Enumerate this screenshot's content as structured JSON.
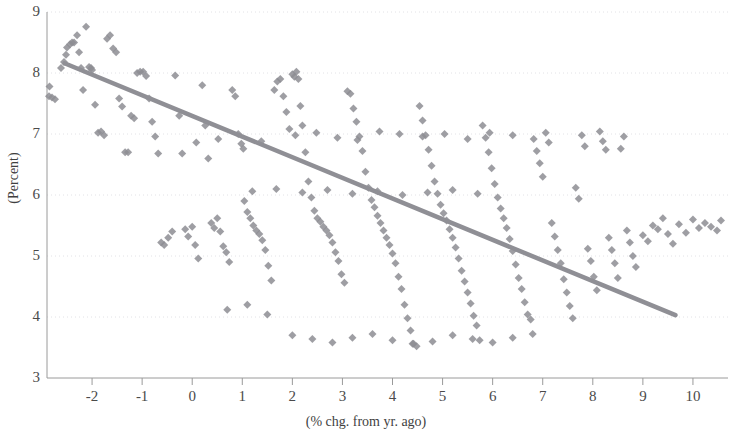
{
  "chart_data": {
    "type": "scatter",
    "title": "",
    "xlabel": "(% chg. from yr. ago)",
    "ylabel": "(Percent)",
    "xlim": [
      -2.9,
      10.7
    ],
    "ylim": [
      3,
      9
    ],
    "xticks": [
      "-2",
      "-1",
      "0",
      "1",
      "2",
      "3",
      "4",
      "5",
      "6",
      "7",
      "8",
      "9",
      "10"
    ],
    "xtick_values": [
      -2,
      -1,
      0,
      1,
      2,
      3,
      4,
      5,
      6,
      7,
      8,
      9,
      10
    ],
    "yticks": [
      "3",
      "4",
      "5",
      "6",
      "7",
      "8",
      "9"
    ],
    "ytick_values": [
      3,
      4,
      5,
      6,
      7,
      8,
      9
    ],
    "grid": true,
    "grid_axis": "y",
    "legend": "none",
    "marker_color": "#8d8d93",
    "marker_shape": "diamond",
    "marker_size": 4,
    "trendline": {
      "color": "#8f8f95",
      "width": 4.5,
      "x0": -2.55,
      "y0": 8.16,
      "x1": 9.65,
      "y1": 4.03
    },
    "points": [
      [
        -2.85,
        7.78
      ],
      [
        -2.86,
        7.62
      ],
      [
        -2.8,
        7.6
      ],
      [
        -2.74,
        7.57
      ],
      [
        -2.62,
        8.08
      ],
      [
        -2.56,
        8.18
      ],
      [
        -2.52,
        8.3
      ],
      [
        -2.5,
        8.42
      ],
      [
        -2.44,
        8.47
      ],
      [
        -2.4,
        8.5
      ],
      [
        -2.36,
        8.5
      ],
      [
        -2.3,
        8.62
      ],
      [
        -2.26,
        8.34
      ],
      [
        -2.22,
        8.08
      ],
      [
        -2.18,
        7.72
      ],
      [
        -2.12,
        8.76
      ],
      [
        -2.06,
        8.1
      ],
      [
        -2.0,
        8.05
      ],
      [
        -2.02,
        8.08
      ],
      [
        -1.94,
        7.48
      ],
      [
        -1.88,
        7.02
      ],
      [
        -1.82,
        7.04
      ],
      [
        -1.76,
        6.98
      ],
      [
        -1.7,
        8.56
      ],
      [
        -1.64,
        8.62
      ],
      [
        -1.58,
        8.4
      ],
      [
        -1.52,
        8.34
      ],
      [
        -1.46,
        7.58
      ],
      [
        -1.4,
        7.45
      ],
      [
        -1.34,
        6.7
      ],
      [
        -1.28,
        6.7
      ],
      [
        -1.22,
        7.3
      ],
      [
        -1.16,
        7.26
      ],
      [
        -1.1,
        8.0
      ],
      [
        -1.04,
        8.02
      ],
      [
        -0.98,
        8.02
      ],
      [
        -0.92,
        7.95
      ],
      [
        -0.86,
        7.58
      ],
      [
        -0.8,
        7.2
      ],
      [
        -0.74,
        6.96
      ],
      [
        -0.68,
        6.68
      ],
      [
        -0.62,
        5.22
      ],
      [
        -0.56,
        5.18
      ],
      [
        -0.48,
        5.3
      ],
      [
        -0.4,
        5.4
      ],
      [
        -0.34,
        7.96
      ],
      [
        -0.26,
        7.3
      ],
      [
        -0.2,
        6.68
      ],
      [
        -0.14,
        5.44
      ],
      [
        -0.08,
        5.32
      ],
      [
        0.0,
        5.48
      ],
      [
        0.06,
        5.18
      ],
      [
        0.12,
        4.96
      ],
      [
        0.2,
        7.8
      ],
      [
        0.26,
        7.14
      ],
      [
        0.32,
        6.6
      ],
      [
        0.38,
        5.54
      ],
      [
        0.44,
        5.46
      ],
      [
        0.5,
        5.62
      ],
      [
        0.56,
        5.4
      ],
      [
        0.62,
        5.16
      ],
      [
        0.68,
        5.06
      ],
      [
        0.74,
        4.9
      ],
      [
        0.8,
        7.72
      ],
      [
        0.86,
        7.62
      ],
      [
        0.92,
        7.0
      ],
      [
        0.98,
        6.84
      ],
      [
        1.04,
        5.9
      ],
      [
        1.1,
        5.72
      ],
      [
        1.16,
        5.62
      ],
      [
        1.22,
        5.5
      ],
      [
        1.28,
        5.42
      ],
      [
        1.34,
        5.36
      ],
      [
        1.4,
        5.26
      ],
      [
        1.46,
        5.1
      ],
      [
        1.52,
        4.84
      ],
      [
        1.58,
        4.6
      ],
      [
        1.64,
        7.72
      ],
      [
        1.7,
        7.86
      ],
      [
        1.76,
        7.9
      ],
      [
        1.82,
        7.62
      ],
      [
        1.88,
        7.36
      ],
      [
        1.94,
        7.08
      ],
      [
        2.0,
        7.98
      ],
      [
        2.04,
        7.94
      ],
      [
        2.08,
        8.02
      ],
      [
        2.12,
        7.9
      ],
      [
        2.16,
        7.46
      ],
      [
        2.2,
        7.14
      ],
      [
        2.26,
        6.7
      ],
      [
        2.32,
        6.22
      ],
      [
        2.38,
        5.96
      ],
      [
        2.44,
        5.74
      ],
      [
        2.5,
        5.62
      ],
      [
        2.56,
        5.56
      ],
      [
        2.62,
        5.48
      ],
      [
        2.68,
        5.42
      ],
      [
        2.74,
        5.34
      ],
      [
        2.8,
        5.22
      ],
      [
        2.86,
        5.06
      ],
      [
        2.92,
        4.92
      ],
      [
        2.98,
        4.7
      ],
      [
        3.04,
        4.56
      ],
      [
        3.1,
        7.7
      ],
      [
        3.16,
        7.66
      ],
      [
        3.22,
        7.42
      ],
      [
        3.28,
        7.2
      ],
      [
        3.34,
        6.96
      ],
      [
        3.4,
        6.72
      ],
      [
        3.46,
        6.38
      ],
      [
        3.52,
        6.12
      ],
      [
        3.58,
        5.92
      ],
      [
        3.64,
        5.8
      ],
      [
        3.7,
        5.66
      ],
      [
        3.76,
        5.54
      ],
      [
        3.82,
        5.42
      ],
      [
        3.88,
        5.3
      ],
      [
        3.94,
        5.18
      ],
      [
        4.0,
        5.04
      ],
      [
        4.06,
        4.88
      ],
      [
        4.12,
        4.66
      ],
      [
        4.18,
        4.46
      ],
      [
        4.24,
        4.2
      ],
      [
        4.3,
        3.98
      ],
      [
        4.36,
        3.78
      ],
      [
        4.42,
        3.56
      ],
      [
        4.48,
        3.52
      ],
      [
        4.54,
        7.46
      ],
      [
        4.6,
        7.22
      ],
      [
        4.66,
        6.98
      ],
      [
        4.72,
        6.74
      ],
      [
        4.78,
        6.48
      ],
      [
        4.84,
        6.22
      ],
      [
        4.9,
        6.02
      ],
      [
        4.96,
        5.84
      ],
      [
        5.02,
        5.7
      ],
      [
        5.08,
        5.58
      ],
      [
        5.14,
        5.44
      ],
      [
        5.2,
        5.3
      ],
      [
        5.26,
        5.14
      ],
      [
        5.32,
        4.96
      ],
      [
        5.38,
        4.76
      ],
      [
        5.44,
        4.58
      ],
      [
        5.5,
        4.4
      ],
      [
        5.56,
        4.22
      ],
      [
        5.62,
        4.02
      ],
      [
        5.68,
        3.86
      ],
      [
        5.74,
        3.62
      ],
      [
        5.8,
        7.14
      ],
      [
        5.86,
        6.94
      ],
      [
        5.92,
        6.7
      ],
      [
        5.98,
        6.44
      ],
      [
        6.04,
        6.18
      ],
      [
        6.1,
        5.96
      ],
      [
        6.16,
        5.78
      ],
      [
        6.22,
        5.62
      ],
      [
        6.28,
        5.46
      ],
      [
        6.34,
        5.28
      ],
      [
        6.4,
        5.08
      ],
      [
        6.46,
        4.86
      ],
      [
        6.52,
        4.64
      ],
      [
        6.58,
        4.46
      ],
      [
        6.64,
        4.24
      ],
      [
        6.7,
        4.04
      ],
      [
        6.76,
        3.96
      ],
      [
        6.82,
        6.92
      ],
      [
        6.88,
        6.72
      ],
      [
        6.94,
        6.52
      ],
      [
        7.0,
        6.3
      ],
      [
        7.06,
        7.02
      ],
      [
        7.12,
        6.86
      ],
      [
        7.18,
        5.54
      ],
      [
        7.24,
        5.32
      ],
      [
        7.3,
        5.1
      ],
      [
        7.36,
        4.88
      ],
      [
        7.42,
        4.62
      ],
      [
        7.48,
        4.4
      ],
      [
        7.54,
        4.18
      ],
      [
        7.6,
        3.98
      ],
      [
        7.66,
        6.12
      ],
      [
        7.72,
        5.94
      ],
      [
        7.78,
        6.98
      ],
      [
        7.84,
        6.8
      ],
      [
        7.9,
        5.12
      ],
      [
        7.96,
        4.92
      ],
      [
        8.02,
        4.66
      ],
      [
        8.08,
        4.44
      ],
      [
        8.14,
        7.04
      ],
      [
        8.2,
        6.88
      ],
      [
        8.26,
        6.74
      ],
      [
        8.32,
        5.3
      ],
      [
        8.38,
        5.1
      ],
      [
        8.44,
        4.88
      ],
      [
        8.5,
        4.64
      ],
      [
        8.56,
        6.76
      ],
      [
        8.62,
        6.96
      ],
      [
        8.68,
        5.42
      ],
      [
        8.74,
        5.22
      ],
      [
        8.8,
        5.0
      ],
      [
        8.86,
        4.82
      ],
      [
        9.0,
        5.34
      ],
      [
        9.1,
        5.24
      ],
      [
        9.2,
        5.5
      ],
      [
        9.3,
        5.44
      ],
      [
        9.4,
        5.62
      ],
      [
        9.5,
        5.36
      ],
      [
        9.6,
        5.2
      ],
      [
        9.72,
        5.52
      ],
      [
        9.86,
        5.38
      ],
      [
        10.0,
        5.6
      ],
      [
        10.12,
        5.46
      ],
      [
        10.24,
        5.54
      ],
      [
        10.36,
        5.48
      ],
      [
        10.48,
        5.42
      ],
      [
        10.56,
        5.58
      ],
      [
        0.08,
        6.86
      ],
      [
        0.52,
        6.92
      ],
      [
        1.02,
        6.76
      ],
      [
        1.38,
        6.88
      ],
      [
        2.06,
        6.98
      ],
      [
        2.48,
        7.02
      ],
      [
        2.9,
        6.94
      ],
      [
        3.3,
        6.9
      ],
      [
        3.74,
        7.04
      ],
      [
        4.14,
        7.0
      ],
      [
        4.6,
        6.96
      ],
      [
        5.04,
        7.0
      ],
      [
        5.5,
        6.92
      ],
      [
        5.94,
        7.02
      ],
      [
        6.4,
        6.98
      ],
      [
        1.2,
        6.06
      ],
      [
        1.68,
        6.1
      ],
      [
        2.2,
        6.04
      ],
      [
        2.7,
        6.08
      ],
      [
        3.2,
        6.02
      ],
      [
        3.7,
        6.06
      ],
      [
        4.2,
        6.0
      ],
      [
        4.7,
        6.04
      ],
      [
        5.2,
        6.08
      ],
      [
        5.7,
        6.02
      ],
      [
        0.7,
        4.12
      ],
      [
        1.1,
        4.2
      ],
      [
        1.5,
        4.04
      ],
      [
        2.0,
        3.7
      ],
      [
        2.4,
        3.64
      ],
      [
        2.8,
        3.58
      ],
      [
        3.2,
        3.66
      ],
      [
        3.6,
        3.72
      ],
      [
        4.0,
        3.62
      ],
      [
        4.4,
        3.56
      ],
      [
        4.8,
        3.6
      ],
      [
        5.2,
        3.7
      ],
      [
        5.6,
        3.64
      ],
      [
        6.0,
        3.58
      ],
      [
        6.4,
        3.66
      ],
      [
        6.8,
        3.72
      ]
    ]
  }
}
